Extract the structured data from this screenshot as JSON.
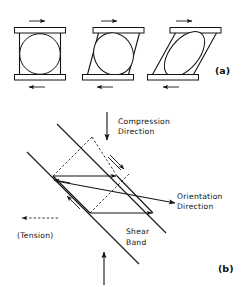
{
  "figure": {
    "panels": [
      {
        "id": "a",
        "label": "(a)",
        "description": "Three stages of shear deformation of a cell with an inclusion",
        "cells": [
          {
            "name": "undeformed-cell",
            "shear": 0,
            "top_arrow": "right",
            "bottom_arrow": "left",
            "inclusion": "circle"
          },
          {
            "name": "partly-sheared-cell",
            "shear": 1,
            "top_arrow": "right",
            "bottom_arrow": "left",
            "inclusion": "ellipse"
          },
          {
            "name": "fully-sheared-cell",
            "shear": 2,
            "top_arrow": "right",
            "bottom_arrow": "left",
            "inclusion": "elongated-ellipse"
          }
        ]
      },
      {
        "id": "b",
        "label": "(b)",
        "description": "Shear band geometry with compression, tension and orientation directions",
        "annotations": [
          {
            "name": "compression-direction",
            "line1": "Compression",
            "line2": "Direction",
            "arrow": "down"
          },
          {
            "name": "orientation-direction",
            "line1": "Orientation",
            "line2": "Direction",
            "arrow": "right"
          },
          {
            "name": "shear-band",
            "line1": "Shear",
            "line2": "Band",
            "arrow": "none"
          },
          {
            "name": "tension-direction",
            "line1": "(Tension)",
            "line2": "",
            "arrow": "left-dashed"
          },
          {
            "name": "compression-bottom",
            "line1": "",
            "line2": "",
            "arrow": "up"
          }
        ]
      }
    ],
    "colors": {
      "stroke": "#141414",
      "text": "#111111",
      "background": "#ffffff"
    }
  }
}
